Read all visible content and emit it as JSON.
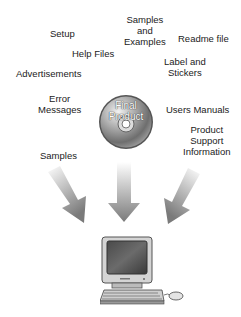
{
  "diagram": {
    "labels": [
      {
        "id": "setup",
        "text": "Setup"
      },
      {
        "id": "samples-examples",
        "text": "Samples\nand\nExamples"
      },
      {
        "id": "readme",
        "text": "Readme file"
      },
      {
        "id": "help-files",
        "text": "Help Files"
      },
      {
        "id": "label-stickers",
        "text": "Label and\nStickers"
      },
      {
        "id": "advertisements",
        "text": "Advertisements"
      },
      {
        "id": "error-messages",
        "text": "Error\nMessages"
      },
      {
        "id": "users-manuals",
        "text": "Users Manuals"
      },
      {
        "id": "product-support",
        "text": "Product\nSupport\nInformation"
      },
      {
        "id": "samples",
        "text": "Samples"
      }
    ],
    "center": {
      "text": "Final\nProduct",
      "icon": "cd-disc-icon"
    },
    "arrows": [
      "arrow-left-diagonal",
      "arrow-down",
      "arrow-right-diagonal"
    ],
    "target": {
      "icon": "desktop-computer-icon"
    }
  }
}
